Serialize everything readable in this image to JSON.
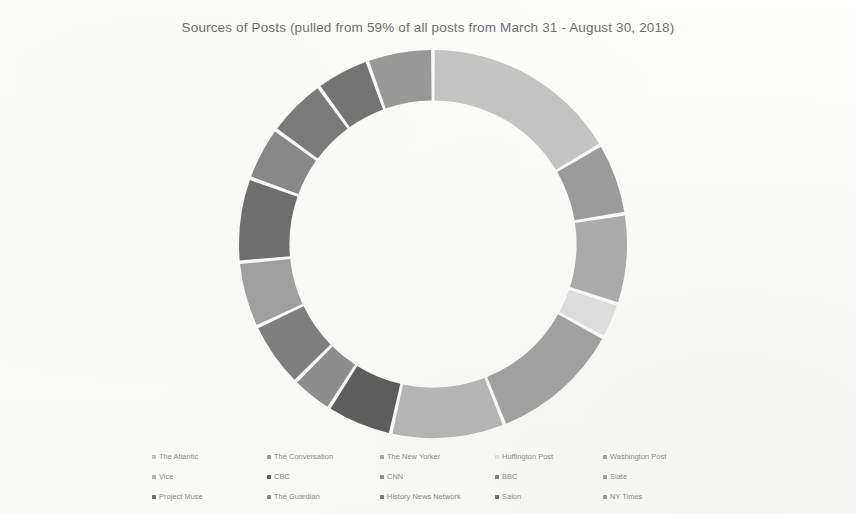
{
  "chart_data": {
    "type": "pie",
    "variant": "donut",
    "title": "Sources of Posts (pulled from 59% of all posts from March 31 - August 30, 2018)",
    "xlabel": "",
    "ylabel": "",
    "grid": false,
    "legend_position": "bottom",
    "legend_columns": 5,
    "start_angle_deg": 0,
    "direction": "clockwise",
    "inner_radius_ratio": 0.74,
    "categories": [
      "The Atlantic",
      "The Conversation",
      "The New Yorker",
      "Huffington Post",
      "Washington Post",
      "Vice",
      "CBC",
      "CNN",
      "BBC",
      "Slate",
      "Project Muse",
      "The Guardian",
      "History News Network",
      "Salon",
      "NY Times"
    ],
    "values": [
      16.5,
      6.0,
      7.5,
      3.0,
      11.0,
      9.5,
      5.5,
      3.5,
      5.5,
      5.5,
      7.0,
      4.5,
      5.0,
      4.5,
      5.5
    ],
    "colors": [
      "#c3c3c3",
      "#9b9b9b",
      "#aaaaaa",
      "#dcdcdc",
      "#a0a0a0",
      "#b4b4b4",
      "#5d5d5d",
      "#8d8d8d",
      "#7e7e7e",
      "#9f9f9f",
      "#6e6e6e",
      "#888888",
      "#7a7a7a",
      "#747474",
      "#989898"
    ],
    "segments": [
      {
        "label": "The Atlantic",
        "value": 16.5,
        "color": "#c3c3c3",
        "start_deg": 0.0,
        "end_deg": 59.4
      },
      {
        "label": "The Conversation",
        "value": 6.0,
        "color": "#9b9b9b",
        "start_deg": 59.4,
        "end_deg": 81.0
      },
      {
        "label": "The New Yorker",
        "value": 7.5,
        "color": "#aaaaaa",
        "start_deg": 81.0,
        "end_deg": 108.0
      },
      {
        "label": "Huffington Post",
        "value": 3.0,
        "color": "#dcdcdc",
        "start_deg": 108.0,
        "end_deg": 118.8
      },
      {
        "label": "Washington Post",
        "value": 11.0,
        "color": "#a0a0a0",
        "start_deg": 118.8,
        "end_deg": 158.4
      },
      {
        "label": "Vice",
        "value": 9.5,
        "color": "#b4b4b4",
        "start_deg": 158.4,
        "end_deg": 192.6
      },
      {
        "label": "CBC",
        "value": 5.5,
        "color": "#5d5d5d",
        "start_deg": 192.6,
        "end_deg": 212.4
      },
      {
        "label": "CNN",
        "value": 3.5,
        "color": "#8d8d8d",
        "start_deg": 212.4,
        "end_deg": 225.0
      },
      {
        "label": "BBC",
        "value": 5.5,
        "color": "#7e7e7e",
        "start_deg": 225.0,
        "end_deg": 244.8
      },
      {
        "label": "Slate",
        "value": 5.5,
        "color": "#9f9f9f",
        "start_deg": 244.8,
        "end_deg": 264.6
      },
      {
        "label": "Project Muse",
        "value": 7.0,
        "color": "#6e6e6e",
        "start_deg": 264.6,
        "end_deg": 289.8
      },
      {
        "label": "The Guardian",
        "value": 4.5,
        "color": "#888888",
        "start_deg": 289.8,
        "end_deg": 306.0
      },
      {
        "label": "History News Network",
        "value": 5.0,
        "color": "#7a7a7a",
        "start_deg": 306.0,
        "end_deg": 324.0
      },
      {
        "label": "Salon",
        "value": 4.5,
        "color": "#747474",
        "start_deg": 324.0,
        "end_deg": 340.2
      },
      {
        "label": "NY Times",
        "value": 5.5,
        "color": "#989898",
        "start_deg": 340.2,
        "end_deg": 360.0
      }
    ]
  },
  "legend": {
    "rows": [
      [
        {
          "label": "The Atlantic",
          "color": "#c3c3c3"
        },
        {
          "label": "The Conversation",
          "color": "#9b9b9b"
        },
        {
          "label": "The New Yorker",
          "color": "#aaaaaa"
        },
        {
          "label": "Huffington Post",
          "color": "#dcdcdc"
        },
        {
          "label": "Washington Post",
          "color": "#a0a0a0"
        }
      ],
      [
        {
          "label": "Vice",
          "color": "#b4b4b4"
        },
        {
          "label": "CBC",
          "color": "#5d5d5d"
        },
        {
          "label": "CNN",
          "color": "#8d8d8d"
        },
        {
          "label": "BBC",
          "color": "#7e7e7e"
        },
        {
          "label": "Slate",
          "color": "#9f9f9f"
        }
      ],
      [
        {
          "label": "Project Muse",
          "color": "#6e6e6e"
        },
        {
          "label": "The Guardian",
          "color": "#888888"
        },
        {
          "label": "History News Network",
          "color": "#7a7a7a"
        },
        {
          "label": "Salon",
          "color": "#747474"
        },
        {
          "label": "NY Times",
          "color": "#989898"
        }
      ]
    ]
  },
  "style": {
    "background": "#fdfdfc",
    "title_color": "#6f6f6f",
    "legend_text_color": "#8a8a8a",
    "segment_gap_color": "#ffffff"
  }
}
